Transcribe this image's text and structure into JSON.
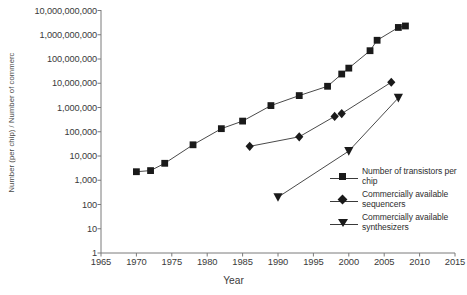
{
  "chart_data": {
    "type": "line",
    "title": "",
    "xlabel": "Year",
    "ylabel": "Number (per chip) / Number of commercial instruments",
    "xlim": [
      1965,
      2015
    ],
    "ylim": [
      1,
      10000000000
    ],
    "yscale": "log",
    "grid": false,
    "legend_position": "inside-right",
    "xticks": [
      "1965",
      "1970",
      "1975",
      "1980",
      "1985",
      "1990",
      "1995",
      "2000",
      "2005",
      "2010",
      "2015"
    ],
    "yticks": [
      "1",
      "10",
      "100",
      "1,000",
      "10,000",
      "100,000",
      "1,000,000",
      "10,000,000",
      "100,000,000",
      "1,000,000,000",
      "10,000,000,000"
    ],
    "series": [
      {
        "name": "Number of transistors per chip",
        "marker": "square",
        "points": [
          {
            "x": 1970,
            "y": 2250
          },
          {
            "x": 1972,
            "y": 2500
          },
          {
            "x": 1974,
            "y": 5000
          },
          {
            "x": 1978,
            "y": 29000
          },
          {
            "x": 1982,
            "y": 134000
          },
          {
            "x": 1985,
            "y": 275000
          },
          {
            "x": 1989,
            "y": 1200000
          },
          {
            "x": 1993,
            "y": 3100000
          },
          {
            "x": 1997,
            "y": 7500000
          },
          {
            "x": 1999,
            "y": 24000000
          },
          {
            "x": 2000,
            "y": 42000000
          },
          {
            "x": 2003,
            "y": 220000000
          },
          {
            "x": 2004,
            "y": 592000000
          },
          {
            "x": 2007,
            "y": 2000000000
          },
          {
            "x": 2008,
            "y": 2300000000
          }
        ]
      },
      {
        "name": "Commercially available sequencers",
        "marker": "diamond",
        "points": [
          {
            "x": 1986,
            "y": 25000
          },
          {
            "x": 1993,
            "y": 62000
          },
          {
            "x": 1998,
            "y": 430000
          },
          {
            "x": 1999,
            "y": 560000
          },
          {
            "x": 2006,
            "y": 11000000
          }
        ]
      },
      {
        "name": "Commercially available synthesizers",
        "marker": "triangle-down",
        "points": [
          {
            "x": 1990,
            "y": 200
          },
          {
            "x": 2000,
            "y": 16000
          },
          {
            "x": 2007,
            "y": 2500000
          }
        ]
      }
    ]
  },
  "legend": {
    "items": [
      {
        "label": "Number of transistors per chip",
        "marker": "square"
      },
      {
        "label": "Commercially available sequencers",
        "marker": "diamond"
      },
      {
        "label": "Commercially available synthesizers",
        "marker": "triangle-down"
      }
    ]
  },
  "colors": {
    "marker": "#1a1a1a",
    "line": "#4a4a4a",
    "axis": "#7a7a7a",
    "text": "#3a3a3a",
    "background": "#ffffff"
  }
}
